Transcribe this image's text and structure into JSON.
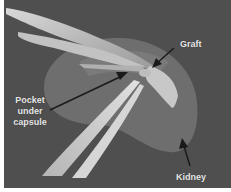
{
  "figure": {
    "type": "anatomical illustration",
    "background_color": "#4f4f4f",
    "labels": {
      "graft": "Graft",
      "pocket_line1": "Pocket",
      "pocket_line2": "under",
      "pocket_line3": "capsule",
      "kidney": "Kidney"
    },
    "colors": {
      "kidney": "#6e6e6e",
      "kidney_dark": "#5e5e5e",
      "instrument_light": "#cfcfcf",
      "instrument_mid": "#a8a8a8",
      "graft": "#c4c4c4",
      "arrow": "#1a1a1a"
    }
  }
}
